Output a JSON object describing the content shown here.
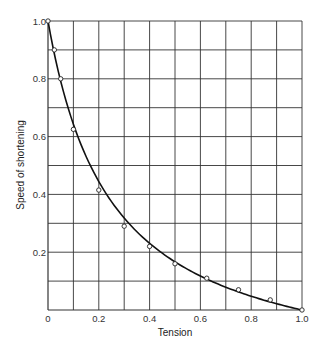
{
  "chart_data": {
    "type": "line",
    "title": "",
    "xlabel": "Tension",
    "ylabel": "Speed of shortening",
    "xlim": [
      0,
      1.0
    ],
    "ylim": [
      0,
      1.0
    ],
    "grid": true,
    "grid_step": {
      "x": 0.1,
      "y": 0.1
    },
    "x_ticks": [
      0,
      0.2,
      0.4,
      0.6,
      0.8,
      1.0
    ],
    "x_tick_labels": [
      "0",
      "0.2",
      "0.4",
      "0.6",
      "0.8",
      "1.0"
    ],
    "y_ticks": [
      0.2,
      0.4,
      0.6,
      0.8,
      1.0
    ],
    "y_tick_labels": [
      "0.2",
      "0.4",
      "0.6",
      "0.8",
      "1.0"
    ],
    "legend": null,
    "series": [
      {
        "name": "measured",
        "style": "open-circle markers",
        "x": [
          0,
          0.025,
          0.05,
          0.1,
          0.2,
          0.3,
          0.4,
          0.5,
          0.625,
          0.75,
          0.875,
          1.0
        ],
        "y": [
          1.0,
          0.9,
          0.8,
          0.625,
          0.415,
          0.29,
          0.22,
          0.16,
          0.11,
          0.07,
          0.035,
          0.0
        ]
      },
      {
        "name": "fitted curve",
        "style": "solid line (hyperbolic)",
        "x": [
          0,
          0.025,
          0.05,
          0.1,
          0.15,
          0.2,
          0.3,
          0.4,
          0.5,
          0.6,
          0.7,
          0.8,
          0.9,
          1.0
        ],
        "y": [
          1.0,
          0.9,
          0.81,
          0.66,
          0.54,
          0.45,
          0.32,
          0.23,
          0.165,
          0.115,
          0.075,
          0.045,
          0.02,
          0.0
        ]
      }
    ]
  },
  "colors": {
    "grid": "#333333",
    "curve": "#111111",
    "marker_fill": "#ffffff",
    "marker_stroke": "#222222",
    "text": "#333333"
  }
}
